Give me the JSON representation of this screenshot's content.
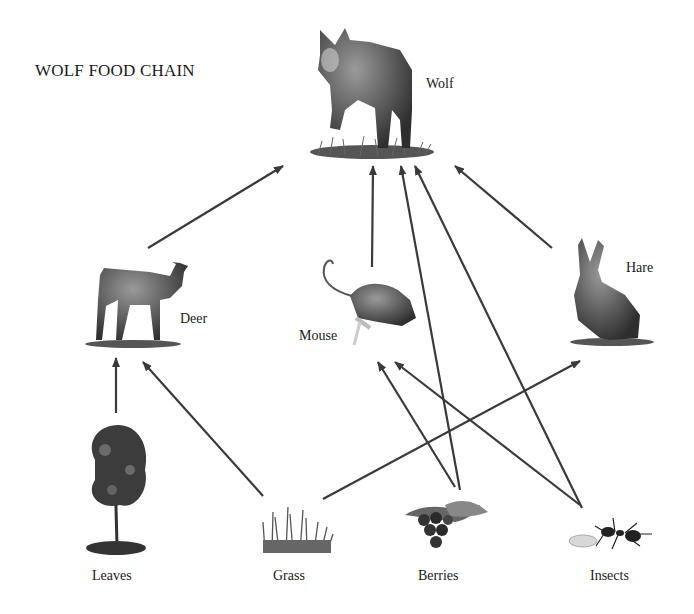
{
  "title": "WOLF FOOD CHAIN",
  "nodes": {
    "wolf": {
      "label": "Wolf",
      "icon": "wolf-icon"
    },
    "deer": {
      "label": "Deer",
      "icon": "deer-icon"
    },
    "mouse": {
      "label": "Mouse",
      "icon": "mouse-icon"
    },
    "hare": {
      "label": "Hare",
      "icon": "hare-icon"
    },
    "leaves": {
      "label": "Leaves",
      "icon": "tree-icon"
    },
    "grass": {
      "label": "Grass",
      "icon": "grass-icon"
    },
    "berries": {
      "label": "Berries",
      "icon": "berries-icon"
    },
    "insects": {
      "label": "Insects",
      "icon": "insects-icon"
    }
  },
  "edges": [
    {
      "from": "Deer",
      "to": "Wolf"
    },
    {
      "from": "Mouse",
      "to": "Wolf"
    },
    {
      "from": "Berries",
      "to": "Wolf"
    },
    {
      "from": "Insects",
      "to": "Wolf"
    },
    {
      "from": "Hare",
      "to": "Wolf"
    },
    {
      "from": "Leaves",
      "to": "Deer"
    },
    {
      "from": "Grass",
      "to": "Deer"
    },
    {
      "from": "Grass",
      "to": "Hare"
    },
    {
      "from": "Berries",
      "to": "Mouse"
    },
    {
      "from": "Insects",
      "to": "Mouse"
    }
  ],
  "colors": {
    "arrow": "#3a3a3a",
    "text": "#1a1a1a",
    "background": "#ffffff"
  }
}
